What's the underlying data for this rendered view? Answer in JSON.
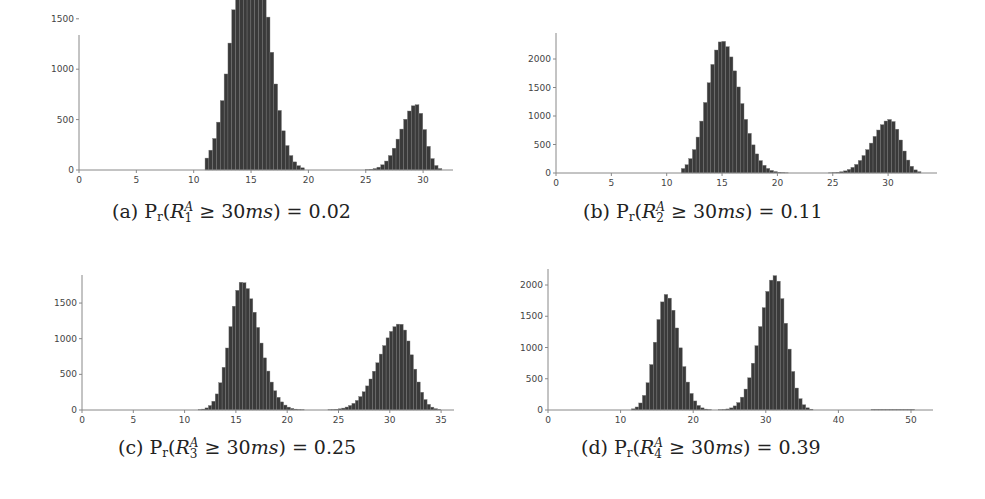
{
  "figure": {
    "captions": [
      {
        "label": "(a)",
        "prefix": "P",
        "prefix_sub": "r",
        "var": "R",
        "var_sup": "A",
        "var_sub": "1",
        "rel": "≥ 30",
        "unit": "ms",
        "rhs": ") = 0.02"
      },
      {
        "label": "(b)",
        "prefix": "P",
        "prefix_sub": "r",
        "var": "R",
        "var_sup": "A",
        "var_sub": "2",
        "rel": "≥ 30",
        "unit": "ms",
        "rhs": ") = 0.11"
      },
      {
        "label": "(c)",
        "prefix": "P",
        "prefix_sub": "r",
        "var": "R",
        "var_sup": "A",
        "var_sub": "3",
        "rel": "≥ 30",
        "unit": "ms",
        "rhs": ") = 0.25"
      },
      {
        "label": "(d)",
        "prefix": "P",
        "prefix_sub": "r",
        "var": "R",
        "var_sup": "A",
        "var_sub": "4",
        "rel": "≥ 30",
        "unit": "ms",
        "rhs": ") = 0.39"
      }
    ],
    "bar_color": "#3a3a3a",
    "axis_color": "#888888"
  },
  "chart_data": [
    {
      "type": "bar",
      "title": "(a) Pr(R_1^A ≥ 30ms) = 0.02",
      "xlabel": "",
      "ylabel": "",
      "xlim": [
        0,
        32.5
      ],
      "ylim": [
        0,
        2700
      ],
      "xticks": [
        0,
        5,
        10,
        15,
        20,
        25,
        30
      ],
      "yticks": [
        0,
        500,
        1000,
        1500,
        2000,
        2500
      ],
      "bin_width": 0.333,
      "modes": [
        {
          "center": 15.0,
          "peak": 2560,
          "sigma_left": 1.55,
          "sigma_right": 1.45,
          "start": 11.0,
          "end": 19.8
        },
        {
          "center": 29.4,
          "peak": 650,
          "sigma_left": 1.3,
          "sigma_right": 0.75,
          "start": 24.5,
          "end": 31.5
        }
      ],
      "grid": false,
      "legend": null
    },
    {
      "type": "bar",
      "title": "(b) Pr(R_2^A ≥ 30ms) = 0.11",
      "xlabel": "",
      "ylabel": "",
      "xlim": [
        0,
        34.5
      ],
      "ylim": [
        0,
        2450
      ],
      "xticks": [
        0,
        5,
        10,
        15,
        20,
        25,
        30
      ],
      "yticks": [
        0,
        500,
        1000,
        1500,
        2000
      ],
      "bin_width": 0.333,
      "modes": [
        {
          "center": 15.0,
          "peak": 2320,
          "sigma_left": 1.35,
          "sigma_right": 1.6,
          "start": 11.3,
          "end": 21.5
        },
        {
          "center": 30.2,
          "peak": 940,
          "sigma_left": 1.6,
          "sigma_right": 0.95,
          "start": 23.3,
          "end": 33.0
        }
      ],
      "grid": false,
      "legend": null
    },
    {
      "type": "bar",
      "title": "(c) Pr(R_3^A ≥ 30ms) = 0.25",
      "xlabel": "",
      "ylabel": "",
      "xlim": [
        0,
        36
      ],
      "ylim": [
        0,
        1900
      ],
      "xticks": [
        0,
        5,
        10,
        15,
        20,
        25,
        30,
        35
      ],
      "yticks": [
        0,
        500,
        1000,
        1500
      ],
      "bin_width": 0.333,
      "modes": [
        {
          "center": 15.6,
          "peak": 1800,
          "sigma_left": 1.2,
          "sigma_right": 1.65,
          "start": 11.3,
          "end": 22.0
        },
        {
          "center": 31.0,
          "peak": 1210,
          "sigma_left": 2.0,
          "sigma_right": 1.2,
          "start": 23.2,
          "end": 34.8
        }
      ],
      "grid": false,
      "legend": null
    },
    {
      "type": "bar",
      "title": "(d) Pr(R_4^A ≥ 30ms) = 0.39",
      "xlabel": "",
      "ylabel": "",
      "xlim": [
        0,
        53
      ],
      "ylim": [
        0,
        2250
      ],
      "xticks": [
        0,
        10,
        20,
        30,
        40,
        50
      ],
      "yticks": [
        0,
        500,
        1000,
        1500,
        2000
      ],
      "bin_width": 0.5,
      "modes": [
        {
          "center": 16.3,
          "peak": 1850,
          "sigma_left": 1.5,
          "sigma_right": 1.75,
          "start": 11.5,
          "end": 22.5
        },
        {
          "center": 31.3,
          "peak": 2150,
          "sigma_left": 2.1,
          "sigma_right": 1.55,
          "start": 22.5,
          "end": 36.5
        }
      ],
      "sparse_tail": {
        "start": 44.5,
        "end": 50.0,
        "value": 8
      },
      "grid": false,
      "legend": null
    }
  ],
  "layout": {
    "panels": [
      {
        "x0": 79,
        "y0": 170,
        "x_end": 453,
        "y_top": 35,
        "px_per_x": 11.47,
        "px_per_y": 0.1008,
        "caption_left": 112,
        "caption_top": 200
      },
      {
        "x0": 556,
        "y0": 173,
        "x_end": 937,
        "y_top": 33,
        "px_per_x": 11.07,
        "px_per_y": 0.057,
        "caption_left": 583,
        "caption_top": 200
      },
      {
        "x0": 82,
        "y0": 410,
        "x_end": 454,
        "y_top": 275,
        "px_per_x": 10.26,
        "px_per_y": 0.0713,
        "caption_left": 118,
        "caption_top": 436
      },
      {
        "x0": 548,
        "y0": 410,
        "x_end": 933,
        "y_top": 269,
        "px_per_x": 7.26,
        "px_per_y": 0.0625,
        "caption_left": 581,
        "caption_top": 436
      }
    ]
  }
}
